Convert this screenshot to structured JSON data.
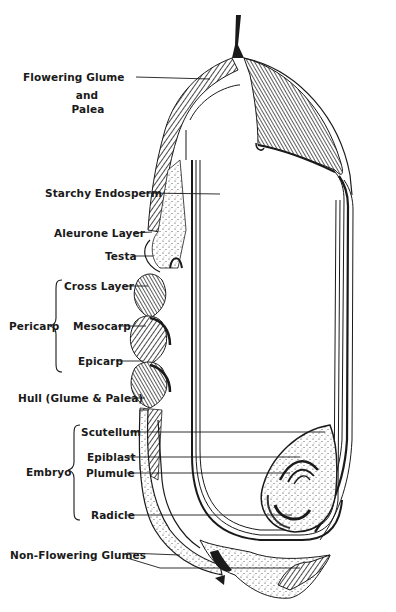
{
  "diagram": {
    "colors": {
      "ink": "#1a1a1a",
      "background": "#ffffff",
      "shade": "#555555"
    },
    "labels": {
      "flowering_glume": "Flowering Glume",
      "and": "and",
      "palea": "Palea",
      "starchy_endosperm": "Starchy Endosperm",
      "aleurone_layer": "Aleurone Layer",
      "testa": "Testa",
      "cross_layer": "Cross Layer",
      "pericarp": "Pericarp",
      "mesocarp": "Mesocarp",
      "epicarp": "Epicarp",
      "hull": "Hull (Glume & Palea)",
      "scutellum": "Scutellum",
      "epiblast": "Epiblast",
      "embryo": "Embryo",
      "plumule": "Plumule",
      "radicle": "Radicle",
      "non_flowering_glumes": "Non-Flowering Glumes"
    },
    "groups": [
      {
        "name": "Pericarp",
        "members": [
          "Cross Layer",
          "Mesocarp",
          "Epicarp"
        ]
      },
      {
        "name": "Embryo",
        "members": [
          "Scutellum",
          "Epiblast",
          "Plumule",
          "Radicle"
        ]
      }
    ]
  }
}
